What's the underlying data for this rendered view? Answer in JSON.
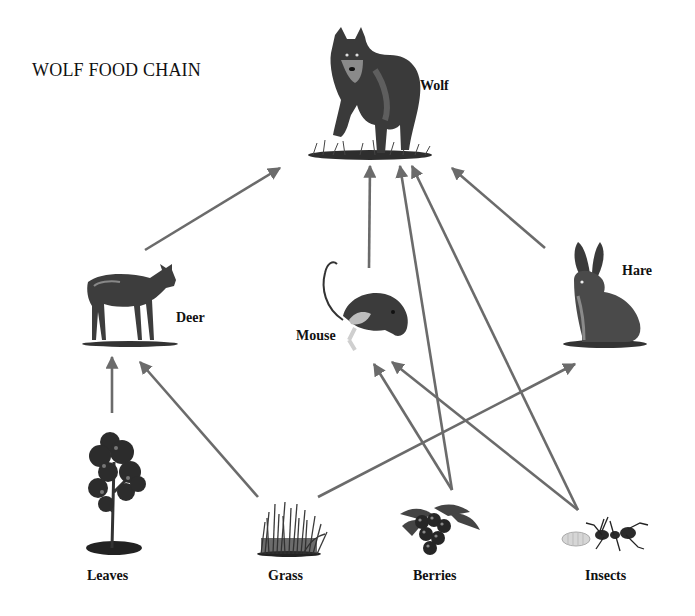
{
  "title": "WOLF FOOD CHAIN",
  "arrow_color": "#6b6b6b",
  "nodes": {
    "wolf": {
      "label": "Wolf",
      "icon": "wolf-icon"
    },
    "deer": {
      "label": "Deer",
      "icon": "deer-icon"
    },
    "mouse": {
      "label": "Mouse",
      "icon": "mouse-icon"
    },
    "hare": {
      "label": "Hare",
      "icon": "hare-icon"
    },
    "leaves": {
      "label": "Leaves",
      "icon": "tree-icon"
    },
    "grass": {
      "label": "Grass",
      "icon": "grass-icon"
    },
    "berries": {
      "label": "Berries",
      "icon": "berries-icon"
    },
    "insects": {
      "label": "Insects",
      "icon": "insects-icon"
    }
  },
  "edges": [
    {
      "from": "Deer",
      "to": "Wolf"
    },
    {
      "from": "Mouse",
      "to": "Wolf"
    },
    {
      "from": "Berries",
      "to": "Wolf"
    },
    {
      "from": "Insects",
      "to": "Wolf"
    },
    {
      "from": "Hare",
      "to": "Wolf"
    },
    {
      "from": "Leaves",
      "to": "Deer"
    },
    {
      "from": "Grass",
      "to": "Deer"
    },
    {
      "from": "Grass",
      "to": "Hare"
    },
    {
      "from": "Berries",
      "to": "Mouse"
    },
    {
      "from": "Insects",
      "to": "Mouse"
    }
  ]
}
